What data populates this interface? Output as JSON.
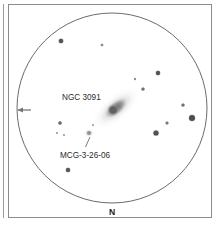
{
  "figure": {
    "kind": "astronomical-eyepiece-sketch",
    "background_color": "#ffffff",
    "ink_color": "#4a4a4a",
    "label_color": "#2b2b2b"
  },
  "frame": {
    "outer_rule": {
      "x": 3,
      "y": 4,
      "width": 1,
      "height": 214,
      "color": "#9a9a9a"
    },
    "border": {
      "x": 8,
      "y": 4,
      "width": 204,
      "height": 214,
      "color": "#8c8c8c"
    }
  },
  "eyepiece_field": {
    "center_x": 112,
    "center_y": 108,
    "radius": 95,
    "stroke_color": "#5a5a5a",
    "stroke_width": 0.9
  },
  "cardinal_markers": [
    {
      "name": "north-marker",
      "label": "N",
      "x": 112,
      "y": 215
    }
  ],
  "direction_arrow": {
    "name": "west-arrow",
    "x": 22,
    "y": 110,
    "points": "left",
    "color": "#777777"
  },
  "labels": [
    {
      "name": "ngc-3091-label",
      "text": "NGC 3091",
      "x": 62,
      "y": 100,
      "anchor": "start"
    },
    {
      "name": "mcg-3-26-06-label",
      "text": "MCG-3-26-06",
      "x": 60,
      "y": 158,
      "anchor": "start"
    }
  ],
  "leader_lines": [
    {
      "name": "mcg-leader-line",
      "x1": 90,
      "y1": 137,
      "x2": 85,
      "y2": 148,
      "color": "#6a6a6a"
    }
  ],
  "galaxies": [
    {
      "name": "ngc-3091",
      "designation": "NGC 3091",
      "center_x": 116,
      "center_y": 108,
      "halo_rx": 26,
      "halo_ry": 11,
      "angle_deg": -40,
      "core_radius": 5.4,
      "core_color": "#646464",
      "halo_color": "#9b9b9b"
    },
    {
      "name": "mcg-3-26-06",
      "designation": "MCG-3-26-06",
      "center_x": 89,
      "center_y": 133,
      "halo_rx": 3.4,
      "halo_ry": 2.8,
      "angle_deg": -30,
      "core_radius": 1.7,
      "core_color": "#8a8a8a",
      "halo_color": "#bdbdbd"
    }
  ],
  "stars": [
    {
      "name": "star-01",
      "x": 61,
      "y": 41,
      "radius": 2.3,
      "color": "#555555"
    },
    {
      "name": "star-02",
      "x": 102,
      "y": 45,
      "radius": 1.3,
      "color": "#8a8a8a"
    },
    {
      "name": "star-03",
      "x": 158,
      "y": 73,
      "radius": 2.2,
      "color": "#555555"
    },
    {
      "name": "star-04",
      "x": 143,
      "y": 89,
      "radius": 1.6,
      "color": "#6f6f6f"
    },
    {
      "name": "star-05",
      "x": 183,
      "y": 105,
      "radius": 1.6,
      "color": "#6f6f6f"
    },
    {
      "name": "star-06",
      "x": 192,
      "y": 118,
      "radius": 3.0,
      "color": "#4d4d4d"
    },
    {
      "name": "star-07",
      "x": 167,
      "y": 123,
      "radius": 1.5,
      "color": "#7a7a7a"
    },
    {
      "name": "star-08",
      "x": 156,
      "y": 133,
      "radius": 2.6,
      "color": "#515151"
    },
    {
      "name": "star-09",
      "x": 60,
      "y": 123,
      "radius": 1.7,
      "color": "#6b6b6b"
    },
    {
      "name": "star-10",
      "x": 57,
      "y": 133,
      "radius": 1.1,
      "color": "#9a9a9a"
    },
    {
      "name": "star-11",
      "x": 64,
      "y": 135,
      "radius": 1.1,
      "color": "#9a9a9a"
    },
    {
      "name": "star-12",
      "x": 68,
      "y": 170,
      "radius": 2.2,
      "color": "#585858"
    },
    {
      "name": "star-13",
      "x": 135,
      "y": 79,
      "radius": 1.2,
      "color": "#8f8f8f"
    },
    {
      "name": "star-14",
      "x": 93,
      "y": 125,
      "radius": 1.1,
      "color": "#9a9a9a"
    }
  ]
}
